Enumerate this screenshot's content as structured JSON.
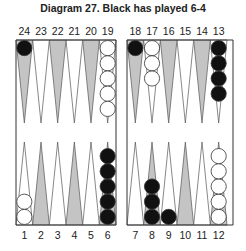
{
  "title": "Diagram 27.  Black has played 6-4",
  "colors": {
    "black_checker": "#111111",
    "white_checker": "#ffffff",
    "dark_point": "#c4c4c4",
    "light_point": "#ffffff",
    "line": "#555555"
  },
  "board": {
    "top_labels": [
      "24",
      "23",
      "22",
      "21",
      "20",
      "19",
      "18",
      "17",
      "16",
      "15",
      "14",
      "13"
    ],
    "bottom_labels": [
      "1",
      "2",
      "3",
      "4",
      "5",
      "6",
      "7",
      "8",
      "9",
      "10",
      "11",
      "12"
    ],
    "dark_points": [
      24,
      22,
      20,
      18,
      16,
      14,
      2,
      4,
      6,
      8,
      10,
      12
    ],
    "positions": [
      {
        "point": 24,
        "color": "black",
        "count": 1
      },
      {
        "point": 19,
        "color": "white",
        "count": 5
      },
      {
        "point": 18,
        "color": "black",
        "count": 1
      },
      {
        "point": 17,
        "color": "white",
        "count": 3
      },
      {
        "point": 13,
        "color": "black",
        "count": 4
      },
      {
        "point": 1,
        "color": "white",
        "count": 2
      },
      {
        "point": 6,
        "color": "black",
        "count": 5
      },
      {
        "point": 8,
        "color": "black",
        "count": 3
      },
      {
        "point": 9,
        "color": "black",
        "count": 1
      },
      {
        "point": 12,
        "color": "white",
        "count": 5
      }
    ]
  }
}
